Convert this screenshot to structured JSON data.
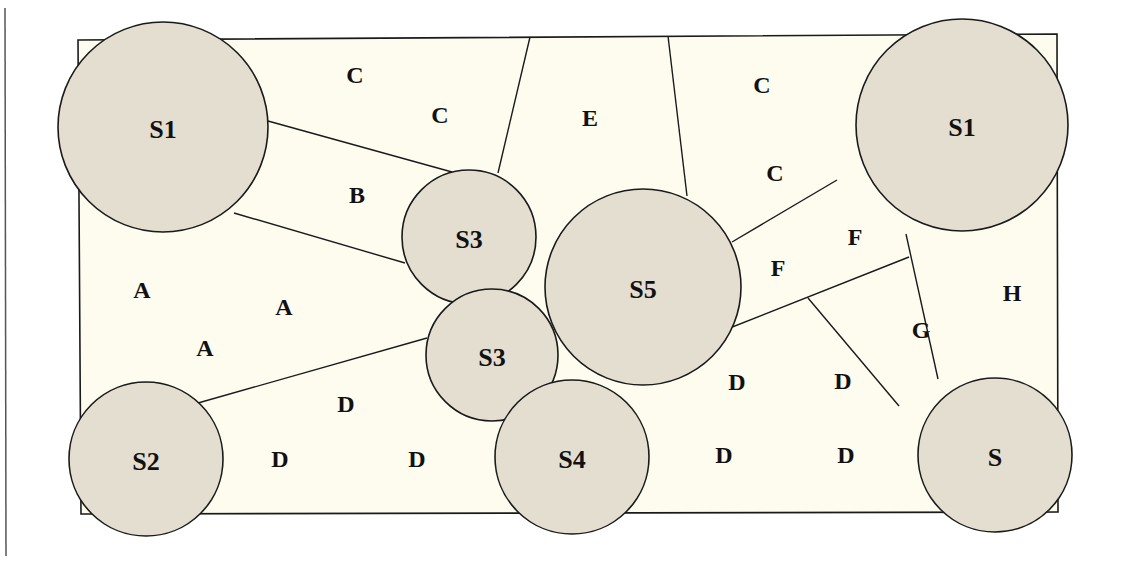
{
  "diagram": {
    "colors": {
      "background": "#ffffff",
      "area_fill": "#fdfcef",
      "node_fill": "#e3ded0",
      "stroke": "#1a1a1a",
      "text": "#111111"
    },
    "nodes": [
      {
        "id": "s1-left",
        "label": "S1",
        "cx": 163,
        "cy": 127,
        "r": 105
      },
      {
        "id": "s1-right",
        "label": "S1",
        "cx": 962,
        "cy": 125,
        "r": 106
      },
      {
        "id": "s3-upper",
        "label": "S3",
        "cx": 469,
        "cy": 237,
        "r": 67
      },
      {
        "id": "s3-lower",
        "label": "S3",
        "cx": 492,
        "cy": 355,
        "r": 66
      },
      {
        "id": "s5",
        "label": "S5",
        "cx": 643,
        "cy": 287,
        "r": 98
      },
      {
        "id": "s2",
        "label": "S2",
        "cx": 146,
        "cy": 459,
        "r": 77
      },
      {
        "id": "s4",
        "label": "S4",
        "cx": 572,
        "cy": 457,
        "r": 77
      },
      {
        "id": "s",
        "label": "S",
        "cx": 995,
        "cy": 455,
        "r": 77
      }
    ],
    "zones": [
      {
        "label": "C",
        "x": 355,
        "y": 75
      },
      {
        "label": "C",
        "x": 440,
        "y": 115
      },
      {
        "label": "E",
        "x": 590,
        "y": 118
      },
      {
        "label": "C",
        "x": 762,
        "y": 85
      },
      {
        "label": "C",
        "x": 775,
        "y": 173
      },
      {
        "label": "B",
        "x": 357,
        "y": 195
      },
      {
        "label": "A",
        "x": 142,
        "y": 290
      },
      {
        "label": "A",
        "x": 284,
        "y": 307
      },
      {
        "label": "A",
        "x": 205,
        "y": 348
      },
      {
        "label": "F",
        "x": 855,
        "y": 237
      },
      {
        "label": "F",
        "x": 778,
        "y": 268
      },
      {
        "label": "H",
        "x": 1012,
        "y": 293
      },
      {
        "label": "G",
        "x": 921,
        "y": 330
      },
      {
        "label": "D",
        "x": 346,
        "y": 404
      },
      {
        "label": "D",
        "x": 280,
        "y": 459
      },
      {
        "label": "D",
        "x": 417,
        "y": 459
      },
      {
        "label": "D",
        "x": 737,
        "y": 382
      },
      {
        "label": "D",
        "x": 843,
        "y": 381
      },
      {
        "label": "D",
        "x": 724,
        "y": 455
      },
      {
        "label": "D",
        "x": 846,
        "y": 455
      }
    ]
  }
}
